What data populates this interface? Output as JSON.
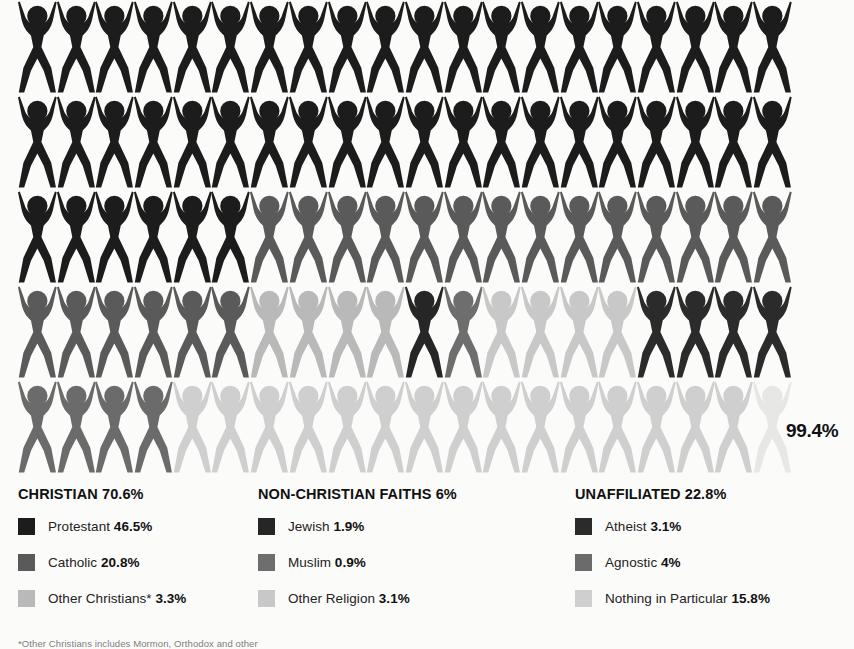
{
  "chart_data": {
    "type": "pictogram",
    "title": "",
    "unit_note": "each figure = 1%",
    "total_label": "99.4%",
    "rows": 5,
    "columns": 20,
    "categories": [
      {
        "key": "protestant",
        "label": "Protestant",
        "value": 46.5,
        "value_label": "46.5%",
        "color": "#1c1c1c",
        "group": "CHRISTIAN"
      },
      {
        "key": "catholic",
        "label": "Catholic",
        "value": 20.8,
        "value_label": "20.8%",
        "color": "#5a5a5a",
        "group": "CHRISTIAN"
      },
      {
        "key": "other_christians",
        "label": "Other Christians*",
        "value": 3.3,
        "value_label": "3.3%",
        "color": "#b9b9b9",
        "group": "CHRISTIAN"
      },
      {
        "key": "jewish",
        "label": "Jewish",
        "value": 1.9,
        "value_label": "1.9%",
        "color": "#262626",
        "group": "NON-CHRISTIAN FAITHS"
      },
      {
        "key": "muslim",
        "label": "Muslim",
        "value": 0.9,
        "value_label": "0.9%",
        "color": "#6e6e6e",
        "group": "NON-CHRISTIAN FAITHS"
      },
      {
        "key": "other_religion",
        "label": "Other Religion",
        "value": 3.1,
        "value_label": "3.1%",
        "color": "#c8c8c8",
        "group": "NON-CHRISTIAN FAITHS"
      },
      {
        "key": "atheist",
        "label": "Atheist",
        "value": 3.1,
        "value_label": "3.1%",
        "color": "#2b2b2b",
        "group": "UNAFFILIATED"
      },
      {
        "key": "agnostic",
        "label": "Agnostic",
        "value": 4,
        "value_label": "4%",
        "color": "#6b6b6b",
        "group": "UNAFFILIATED"
      },
      {
        "key": "nothing_in_particular",
        "label": "Nothing in Particular",
        "value": 15.8,
        "value_label": "15.8%",
        "color": "#cfcfcf",
        "group": "UNAFFILIATED"
      }
    ],
    "grid_sequence": [
      [
        "protestant",
        "protestant",
        "protestant",
        "protestant",
        "protestant",
        "protestant",
        "protestant",
        "protestant",
        "protestant",
        "protestant",
        "protestant",
        "protestant",
        "protestant",
        "protestant",
        "protestant",
        "protestant",
        "protestant",
        "protestant",
        "protestant",
        "protestant"
      ],
      [
        "protestant",
        "protestant",
        "protestant",
        "protestant",
        "protestant",
        "protestant",
        "protestant",
        "protestant",
        "protestant",
        "protestant",
        "protestant",
        "protestant",
        "protestant",
        "protestant",
        "protestant",
        "protestant",
        "protestant",
        "protestant",
        "protestant",
        "protestant"
      ],
      [
        "protestant",
        "protestant",
        "protestant",
        "protestant",
        "protestant",
        "protestant",
        "catholic",
        "catholic",
        "catholic",
        "catholic",
        "catholic",
        "catholic",
        "catholic",
        "catholic",
        "catholic",
        "catholic",
        "catholic",
        "catholic",
        "catholic",
        "catholic"
      ],
      [
        "catholic",
        "catholic",
        "catholic",
        "catholic",
        "catholic",
        "catholic",
        "other_christians",
        "other_christians",
        "other_christians",
        "other_christians",
        "jewish",
        "muslim",
        "other_religion",
        "other_religion",
        "other_religion",
        "other_religion",
        "atheist",
        "atheist",
        "atheist",
        "atheist"
      ],
      [
        "agnostic",
        "agnostic",
        "agnostic",
        "agnostic",
        "nothing_in_particular",
        "nothing_in_particular",
        "nothing_in_particular",
        "nothing_in_particular",
        "nothing_in_particular",
        "nothing_in_particular",
        "nothing_in_particular",
        "nothing_in_particular",
        "nothing_in_particular",
        "nothing_in_particular",
        "nothing_in_particular",
        "nothing_in_particular",
        "nothing_in_particular",
        "nothing_in_particular",
        "nothing_in_particular",
        "nothing_in_particular_partial"
      ]
    ],
    "ylabel": "",
    "xlabel": "",
    "legend_position": "bottom"
  },
  "total": {
    "label": "99.4%"
  },
  "legend": {
    "columns": [
      {
        "id": "christian",
        "header": "CHRISTIAN 70.6%",
        "items": [
          {
            "label": "Protestant",
            "value": "46.5%",
            "color": "#1c1c1c",
            "name": "legend-item-protestant"
          },
          {
            "label": "Catholic",
            "value": "20.8%",
            "color": "#5a5a5a",
            "name": "legend-item-catholic"
          },
          {
            "label": "Other Christians*",
            "value": "3.3%",
            "color": "#b9b9b9",
            "name": "legend-item-other-christians"
          }
        ]
      },
      {
        "id": "non-christian-faiths",
        "header": "NON-CHRISTIAN FAITHS 6%",
        "items": [
          {
            "label": "Jewish",
            "value": "1.9%",
            "color": "#262626",
            "name": "legend-item-jewish"
          },
          {
            "label": "Muslim",
            "value": "0.9%",
            "color": "#6e6e6e",
            "name": "legend-item-muslim"
          },
          {
            "label": "Other Religion",
            "value": "3.1%",
            "color": "#c8c8c8",
            "name": "legend-item-other-religion"
          }
        ]
      },
      {
        "id": "unaffiliated",
        "header": "UNAFFILIATED 22.8%",
        "items": [
          {
            "label": "Atheist",
            "value": "3.1%",
            "color": "#2b2b2b",
            "name": "legend-item-atheist"
          },
          {
            "label": "Agnostic",
            "value": "4%",
            "color": "#6b6b6b",
            "name": "legend-item-agnostic"
          },
          {
            "label": "Nothing in Particular",
            "value": "15.8%",
            "color": "#cfcfcf",
            "name": "legend-item-nothing-in-particular"
          }
        ]
      }
    ]
  },
  "footnote": {
    "text": "*Other Christians includes Mormon, Orthodox and other"
  }
}
